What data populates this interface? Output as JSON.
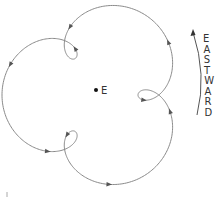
{
  "diagram": {
    "center_label": "E",
    "direction_label": "EASTWARD",
    "direction_letters": [
      "E",
      "A",
      "S",
      "T",
      "W",
      "A",
      "R",
      "D"
    ],
    "colors": {
      "path": "#8a8a8a",
      "arrow": "#555555",
      "text": "#333333",
      "dot": "#111111"
    }
  }
}
